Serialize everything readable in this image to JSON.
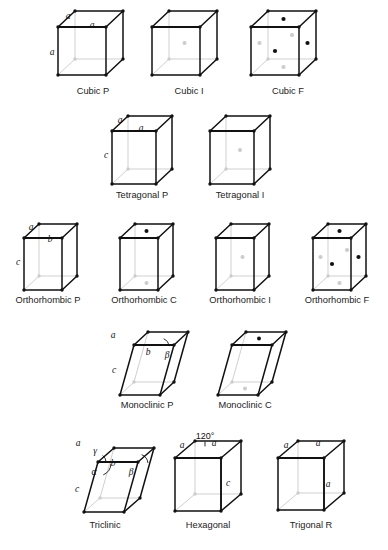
{
  "figure": {
    "background_color": "#ffffff",
    "front_edge_color": "#111111",
    "hidden_edge_color": "#c9c9c9",
    "vertex_color": "#111111",
    "front_node_color": "#111111",
    "hidden_node_color": "#cccccc"
  },
  "rows": [
    {
      "name": "cubic-row",
      "cells": [
        {
          "id": "cubic-p",
          "caption": "Cubic P",
          "caption_x": 93,
          "caption_y": 94,
          "origin_x": 58,
          "origin_y": 27,
          "width": 48,
          "height": 48,
          "depth_x": 17,
          "depth_y": -16,
          "shear_x": 0,
          "centering": "P",
          "edge_labels": [
            {
              "text": "a",
              "x": 68,
              "y": 17
            },
            {
              "text": "a",
              "x": 92,
              "y": 26
            },
            {
              "text": "a",
              "x": 52,
              "y": 53
            }
          ],
          "angle_labels": []
        },
        {
          "id": "cubic-i",
          "caption": "Cubic I",
          "caption_x": 189,
          "caption_y": 94,
          "origin_x": 152,
          "origin_y": 27,
          "width": 48,
          "height": 48,
          "depth_x": 17,
          "depth_y": -16,
          "shear_x": 0,
          "centering": "I",
          "edge_labels": [],
          "angle_labels": []
        },
        {
          "id": "cubic-f",
          "caption": "Cubic F",
          "caption_x": 288,
          "caption_y": 94,
          "origin_x": 251,
          "origin_y": 27,
          "width": 48,
          "height": 48,
          "depth_x": 17,
          "depth_y": -16,
          "shear_x": 0,
          "centering": "F",
          "edge_labels": [],
          "angle_labels": []
        }
      ]
    },
    {
      "name": "tetragonal-row",
      "cells": [
        {
          "id": "tetragonal-p",
          "caption": "Tetragonal P",
          "caption_x": 142,
          "caption_y": 198,
          "origin_x": 112,
          "origin_y": 131,
          "width": 44,
          "height": 53,
          "depth_x": 16,
          "depth_y": -15,
          "shear_x": 0,
          "centering": "P",
          "edge_labels": [
            {
              "text": "a",
              "x": 120,
              "y": 121
            },
            {
              "text": "a",
              "x": 141,
              "y": 129
            },
            {
              "text": "c",
              "x": 106,
              "y": 156
            }
          ],
          "angle_labels": []
        },
        {
          "id": "tetragonal-i",
          "caption": "Tetragonal I",
          "caption_x": 240,
          "caption_y": 198,
          "origin_x": 210,
          "origin_y": 131,
          "width": 44,
          "height": 53,
          "depth_x": 16,
          "depth_y": -15,
          "shear_x": 0,
          "centering": "I",
          "edge_labels": [],
          "angle_labels": []
        }
      ]
    },
    {
      "name": "orthorhombic-row",
      "cells": [
        {
          "id": "orthorhombic-p",
          "caption": "Orthorhombic P",
          "caption_x": 48,
          "caption_y": 303,
          "origin_x": 24,
          "origin_y": 238,
          "width": 38,
          "height": 52,
          "depth_x": 15,
          "depth_y": -14,
          "shear_x": 0,
          "centering": "P",
          "edge_labels": [
            {
              "text": "a",
              "x": 31,
              "y": 228
            },
            {
              "text": "b",
              "x": 50,
              "y": 240
            },
            {
              "text": "c",
              "x": 18,
              "y": 263
            }
          ],
          "angle_labels": []
        },
        {
          "id": "orthorhombic-c",
          "caption": "Orthorhombic C",
          "caption_x": 144,
          "caption_y": 303,
          "origin_x": 120,
          "origin_y": 238,
          "width": 38,
          "height": 52,
          "depth_x": 15,
          "depth_y": -14,
          "shear_x": 0,
          "centering": "C",
          "edge_labels": [],
          "angle_labels": []
        },
        {
          "id": "orthorhombic-i",
          "caption": "Orthorhombic I",
          "caption_x": 240,
          "caption_y": 303,
          "origin_x": 216,
          "origin_y": 238,
          "width": 38,
          "height": 52,
          "depth_x": 15,
          "depth_y": -14,
          "shear_x": 0,
          "centering": "I",
          "edge_labels": [],
          "angle_labels": []
        },
        {
          "id": "orthorhombic-f",
          "caption": "Orthorhombic F",
          "caption_x": 337,
          "caption_y": 303,
          "origin_x": 313,
          "origin_y": 238,
          "width": 38,
          "height": 52,
          "depth_x": 15,
          "depth_y": -14,
          "shear_x": 0,
          "centering": "F",
          "edge_labels": [],
          "angle_labels": []
        }
      ]
    },
    {
      "name": "monoclinic-row",
      "cells": [
        {
          "id": "monoclinic-p",
          "caption": "Monoclinic P",
          "caption_x": 147,
          "caption_y": 408,
          "origin_x": 120,
          "origin_y": 345,
          "width": 40,
          "height": 50,
          "depth_x": 14,
          "depth_y": -13,
          "shear_x": 14,
          "centering": "P",
          "edge_labels": [
            {
              "text": "a",
              "x": 113,
              "y": 336
            },
            {
              "text": "b",
              "x": 148,
              "y": 353
            },
            {
              "text": "c",
              "x": 114,
              "y": 371
            }
          ],
          "angle_labels": [
            {
              "text": "β",
              "x": 167,
              "y": 356
            }
          ]
        },
        {
          "id": "monoclinic-c",
          "caption": "Monoclinic C",
          "caption_x": 245,
          "caption_y": 408,
          "origin_x": 218,
          "origin_y": 345,
          "width": 40,
          "height": 50,
          "depth_x": 14,
          "depth_y": -13,
          "shear_x": 14,
          "centering": "C",
          "edge_labels": [],
          "angle_labels": []
        }
      ]
    },
    {
      "name": "triclinic-row",
      "cells": [
        {
          "id": "triclinic",
          "caption": "Triclinic",
          "caption_x": 105,
          "caption_y": 528,
          "origin_x": 84,
          "origin_y": 462,
          "width": 40,
          "height": 50,
          "depth_x": 16,
          "depth_y": -14,
          "shear_x": 14,
          "centering": "P",
          "edge_labels": [
            {
              "text": "a",
              "x": 78,
              "y": 444
            },
            {
              "text": "b",
              "x": 113,
              "y": 464
            },
            {
              "text": "c",
              "x": 77,
              "y": 490
            }
          ],
          "angle_labels": [
            {
              "text": "γ",
              "x": 95,
              "y": 452
            },
            {
              "text": "α",
              "x": 94,
              "y": 473
            },
            {
              "text": "β",
              "x": 131,
              "y": 473
            }
          ]
        },
        {
          "id": "hexagonal",
          "caption": "Hexagonal",
          "caption_x": 208,
          "caption_y": 528,
          "origin_x": 175,
          "origin_y": 458,
          "width": 46,
          "height": 53,
          "depth_x": 20,
          "depth_y": -17,
          "shear_x": 0,
          "centering": "P",
          "bold_center_edge": true,
          "edge_labels": [
            {
              "text": "a",
              "x": 182,
              "y": 446
            },
            {
              "text": "a",
              "x": 214,
              "y": 444
            },
            {
              "text": "c",
              "x": 228,
              "y": 484
            }
          ],
          "angle_labels": [],
          "degree_labels": [
            {
              "text": "120°",
              "x": 205,
              "y": 437
            }
          ]
        },
        {
          "id": "trigonal-r",
          "caption": "Trigonal R",
          "caption_x": 311,
          "caption_y": 528,
          "origin_x": 278,
          "origin_y": 458,
          "width": 46,
          "height": 52,
          "depth_x": 20,
          "depth_y": -17,
          "shear_x": 0,
          "centering": "P",
          "bold_center_edge": true,
          "edge_labels": [
            {
              "text": "a",
              "x": 286,
              "y": 446
            },
            {
              "text": "a",
              "x": 318,
              "y": 444
            },
            {
              "text": "a",
              "x": 328,
              "y": 485
            }
          ],
          "angle_labels": []
        }
      ]
    }
  ]
}
